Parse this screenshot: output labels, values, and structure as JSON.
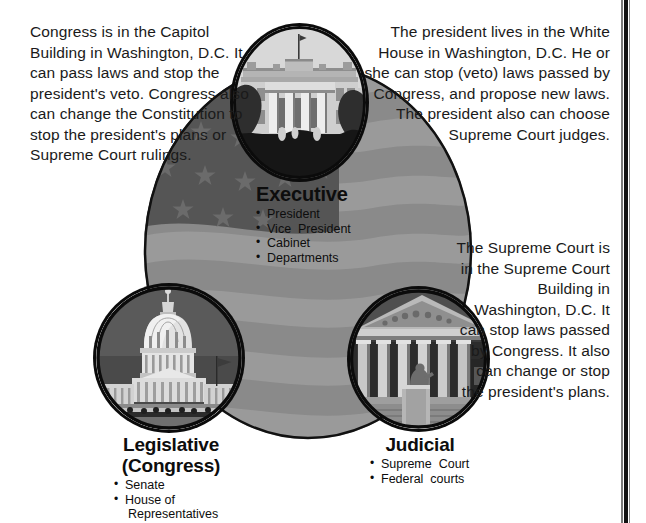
{
  "page": {
    "background_color": "#ffffff",
    "border_color": "#121212"
  },
  "paragraphs": {
    "legislative": "Congress is in the Capitol Building in Washington, D.C. It can pass laws and stop the president's veto. Congress also can change the Constitution to stop the president's plans or Supreme Court rulings.",
    "executive": "The president lives in the White House in Washington, D.C.  He or she can stop (veto) laws passed by Congress, and propose new laws. The president also can choose Supreme Court judges.",
    "judicial": "The Supreme Court is in the Supreme Court Building in Washington, D.C.  It can stop laws passed by Congress.  It also can change or stop the president's plans."
  },
  "branches": [
    {
      "key": "executive",
      "title": "Executive",
      "subtitle": "",
      "members": [
        "President",
        "Vice  President",
        "Cabinet",
        "Departments"
      ],
      "photo": "white-house-photo"
    },
    {
      "key": "legislative",
      "title": "Legislative",
      "subtitle": "(Congress)",
      "members": [
        "Senate",
        "House of",
        "Representatives"
      ],
      "photo": "capitol-building-photo"
    },
    {
      "key": "judicial",
      "title": "Judicial",
      "subtitle": "",
      "members": [
        "Supreme  Court",
        "Federal  courts"
      ],
      "photo": "supreme-court-building-photo"
    }
  ],
  "flag": {
    "name": "american-flag-oval",
    "stripe_light": "#9a9a9a",
    "stripe_dark": "#8a8a8a",
    "canton_color": "#555555",
    "star_color": "#6b6b6b",
    "outline_color": "#111111",
    "stripe_count": 13,
    "star_count": 13
  },
  "photos": {
    "white_house": {
      "name": "white-house-photo",
      "alt": "The White House"
    },
    "capitol": {
      "name": "capitol-building-photo",
      "alt": "United States Capitol Building"
    },
    "supreme_court": {
      "name": "supreme-court-building-photo",
      "alt": "Supreme Court Building"
    }
  }
}
